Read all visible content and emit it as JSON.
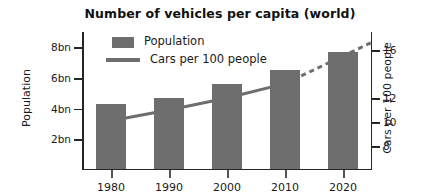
{
  "chart_data": {
    "type": "bar",
    "title": "Number of vehicles per capita (world)",
    "xlabel": "",
    "ylabel": "Population",
    "y2label": "Cars per 100 people",
    "categories": [
      "1980",
      "1990",
      "2000",
      "2010",
      "2020"
    ],
    "grid": false,
    "legend_position": "top-left",
    "left_axis": {
      "label": "Population",
      "ticks": [
        "2bn",
        "4bn",
        "6bn",
        "8bn"
      ],
      "tick_values": [
        2,
        4,
        6,
        8
      ],
      "ylim": [
        0,
        9
      ]
    },
    "right_axis": {
      "label": "Cars per 100 people",
      "ticks": [
        "8",
        "10",
        "12",
        "16"
      ],
      "tick_values": [
        8,
        10,
        12,
        16
      ],
      "ylim": [
        6,
        17.5
      ]
    },
    "series": [
      {
        "name": "Population",
        "type": "bar",
        "unit": "bn",
        "axis": "left",
        "color": "#6e6e6e",
        "values": [
          4.2,
          4.6,
          5.5,
          6.4,
          7.6
        ]
      },
      {
        "name": "Cars per 100 people",
        "type": "line",
        "axis": "right",
        "color": "#6e6e6e",
        "values": [
          10.1,
          11.0,
          12.0,
          13.2,
          15.5
        ],
        "solid_through": "2010",
        "projected_from": "2010",
        "note": "solid 1980-2010, dashed projection 2010 onward"
      }
    ]
  },
  "legend": {
    "items": [
      {
        "label": "Population",
        "marker": "swatch"
      },
      {
        "label": "Cars per 100 people",
        "marker": "line"
      }
    ]
  }
}
